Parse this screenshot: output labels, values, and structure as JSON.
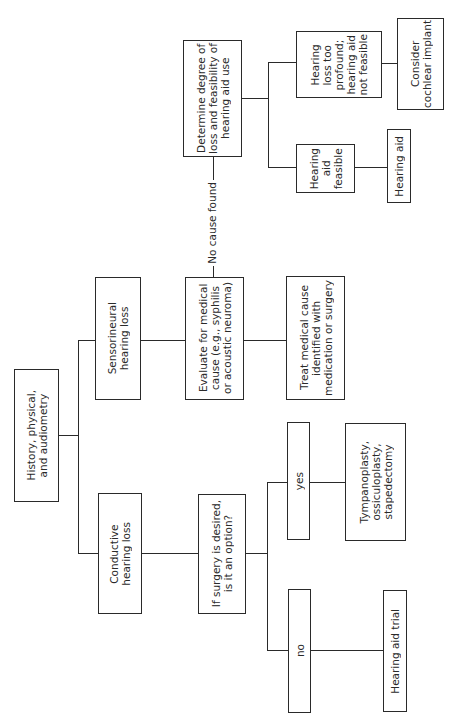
{
  "diagram": {
    "orientation": "rotated 90° counter-clockwise (reads bottom-to-top)",
    "nodes": {
      "root": "History, physical,\nand audiometry",
      "sensorineural": "Sensorineural\nhearing loss",
      "conductive": "Conductive\nhearing loss",
      "evaluate": "Evaluate for medical\ncause (e.g., syphilis\nor acoustic neuroma)",
      "treat": "Treat medical cause\nidentified with\nmedication or surgery",
      "determine": "Determine degree of\nloss and feasibility of\nhearing aid use",
      "feasible": "Hearing\naid\nfeasible",
      "too_profound": "Hearing\nloss too\nprofound;\nhearing aid\nnot feasible",
      "hearing_aid": "Hearing aid",
      "cochlear": "Consider\ncochlear implant",
      "surgery_q": "If surgery is desired,\nis it an option?",
      "yes": "yes",
      "no": "no",
      "tympano": "Tympanoplasty,\nossiculoplasty,\nstapedectomy",
      "aid_trial": "Hearing aid trial"
    },
    "edge_labels": {
      "no_cause": "No cause found"
    },
    "edges": [
      [
        "root",
        "sensorineural"
      ],
      [
        "root",
        "conductive"
      ],
      [
        "sensorineural",
        "evaluate"
      ],
      [
        "evaluate",
        "treat"
      ],
      [
        "evaluate",
        "determine",
        "No cause found"
      ],
      [
        "determine",
        "feasible"
      ],
      [
        "determine",
        "too_profound"
      ],
      [
        "feasible",
        "hearing_aid"
      ],
      [
        "too_profound",
        "cochlear"
      ],
      [
        "conductive",
        "surgery_q"
      ],
      [
        "surgery_q",
        "yes"
      ],
      [
        "surgery_q",
        "no"
      ],
      [
        "yes",
        "tympano"
      ],
      [
        "no",
        "aid_trial"
      ]
    ]
  }
}
